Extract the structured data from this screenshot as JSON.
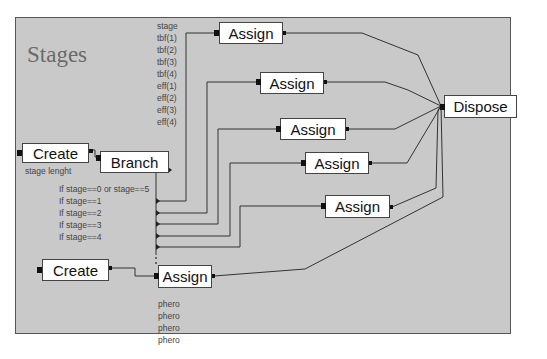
{
  "diagram": {
    "title": "Stages",
    "colors": {
      "canvas": "#c9c9c9",
      "block": "#ffffff",
      "wire": "#333333",
      "label": "#444444"
    },
    "blocks": {
      "create_main": {
        "label": "Create",
        "caption": "stage lenght"
      },
      "branch": {
        "label": "Branch",
        "conditions": [
          "If stage==0 or stage==5",
          "If stage==1",
          "If stage==2",
          "If stage==3",
          "If stage==4"
        ]
      },
      "assign_1": {
        "label": "Assign",
        "variables": [
          "stage",
          "tbf(1)",
          "tbf(2)",
          "tbf(3)",
          "tbf(4)",
          "eff(1)",
          "eff(2)",
          "eff(3)",
          "eff(4)"
        ]
      },
      "assign_2": {
        "label": "Assign"
      },
      "assign_3": {
        "label": "Assign"
      },
      "assign_4": {
        "label": "Assign"
      },
      "assign_5": {
        "label": "Assign"
      },
      "dispose": {
        "label": "Dispose"
      },
      "create_phero": {
        "label": "Create"
      },
      "assign_phero": {
        "label": "Assign",
        "variables": [
          "phero",
          "phero",
          "phero",
          "phero"
        ]
      }
    }
  }
}
